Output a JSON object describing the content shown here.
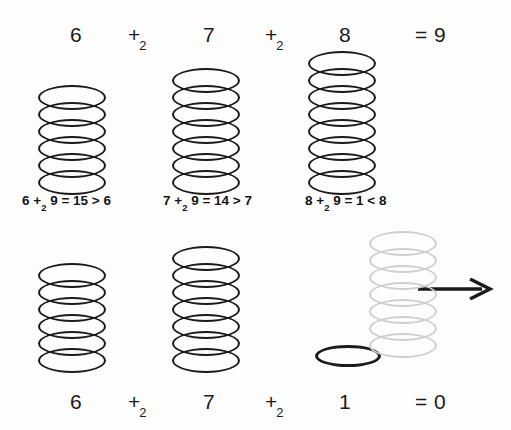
{
  "figure": {
    "width": 511,
    "height": 430,
    "background_color": "#fdfdfd",
    "ink_color": "#1a1a1a",
    "faded_color": "#cfcfcf"
  },
  "top_row": {
    "terms": [
      {
        "label": "6",
        "x": 70,
        "y": 24
      },
      {
        "label": "7",
        "x": 203,
        "y": 24
      },
      {
        "label": "8",
        "x": 339,
        "y": 24
      }
    ],
    "operators": [
      {
        "base": "+",
        "sub": "2",
        "x": 128,
        "y": 24
      },
      {
        "base": "+",
        "sub": "2",
        "x": 265,
        "y": 24
      }
    ],
    "result": {
      "label": "= 9",
      "x": 415,
      "y": 24
    }
  },
  "equations": [
    {
      "text": "6 +",
      "sub": "2",
      "tail": " 9 = 15 > 6",
      "x": 22,
      "y": 194
    },
    {
      "text": "7 +",
      "sub": "2",
      "tail": " 9 = 14 > 7",
      "x": 163,
      "y": 194
    },
    {
      "text": "8 +",
      "sub": "2",
      "tail": " 9 = 1 < 8",
      "x": 305,
      "y": 194
    }
  ],
  "bottom_row": {
    "terms": [
      {
        "label": "6",
        "x": 70,
        "y": 391
      },
      {
        "label": "7",
        "x": 203,
        "y": 391
      },
      {
        "label": "1",
        "x": 339,
        "y": 391
      }
    ],
    "operators": [
      {
        "base": "+",
        "sub": "2",
        "x": 128,
        "y": 391
      },
      {
        "base": "+",
        "sub": "2",
        "x": 265,
        "y": 391
      }
    ],
    "result": {
      "label": "= 0",
      "x": 415,
      "y": 391
    }
  },
  "stacks": [
    {
      "id": "top-stack-6",
      "count": 6,
      "x": 38,
      "top": 85,
      "ring_width": 68,
      "ring_height": 25,
      "pitch": 17,
      "faded": false
    },
    {
      "id": "top-stack-7",
      "count": 7,
      "x": 172,
      "top": 68,
      "ring_width": 68,
      "ring_height": 25,
      "pitch": 17,
      "faded": false
    },
    {
      "id": "top-stack-8",
      "count": 8,
      "x": 308,
      "top": 51,
      "ring_width": 68,
      "ring_height": 25,
      "pitch": 17,
      "faded": false
    },
    {
      "id": "bottom-stack-6",
      "count": 6,
      "x": 38,
      "top": 263,
      "ring_width": 68,
      "ring_height": 25,
      "pitch": 17,
      "faded": false
    },
    {
      "id": "bottom-stack-7",
      "count": 7,
      "x": 172,
      "top": 246,
      "ring_width": 68,
      "ring_height": 25,
      "pitch": 17,
      "faded": false
    },
    {
      "id": "bottom-stack-faded-7",
      "count": 7,
      "x": 369,
      "top": 231,
      "ring_width": 68,
      "ring_height": 25,
      "pitch": 17,
      "faded": true
    }
  ],
  "single_ring": {
    "id": "bottom-single-ring-1",
    "x": 315,
    "y": 345,
    "width": 66,
    "height": 22
  },
  "arrow": {
    "id": "transfer-arrow",
    "x": 418,
    "y": 278,
    "width": 80,
    "height": 22,
    "direction": "right"
  }
}
